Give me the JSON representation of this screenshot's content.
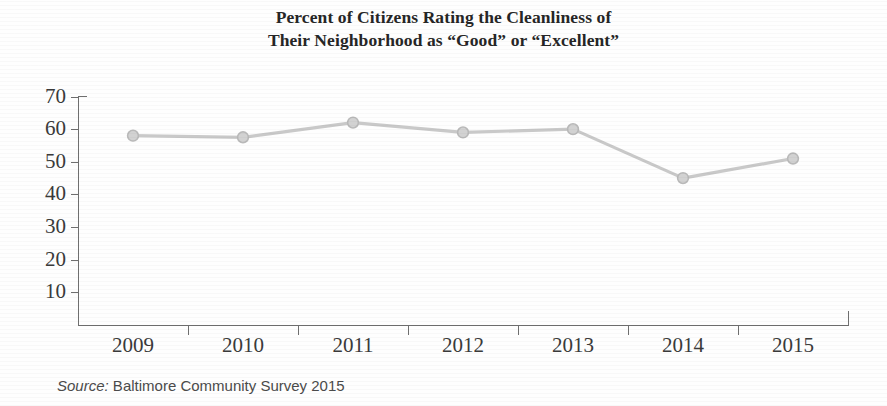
{
  "title": {
    "line1": "Percent of Citizens Rating the Cleanliness of",
    "line2": "Their Neighborhood as “Good” or “Excellent”"
  },
  "source": {
    "label": "Source:",
    "text": " Baltimore Community Survey 2015"
  },
  "colors": {
    "series_line": "#c9c9c9",
    "marker_fill": "#d2d2d2",
    "marker_stroke": "#b9b9b9",
    "axis": "#6f6f6f",
    "text": "#2b2b2b"
  },
  "chart_data": {
    "type": "line",
    "title": "Percent of Citizens Rating the Cleanliness of Their Neighborhood as “Good” or “Excellent”",
    "xlabel": "",
    "ylabel": "",
    "categories": [
      "2009",
      "2010",
      "2011",
      "2012",
      "2013",
      "2014",
      "2015"
    ],
    "values": [
      58,
      57.5,
      62,
      59,
      60,
      45,
      51
    ],
    "ylim": [
      0,
      70
    ],
    "yticks": [
      10,
      20,
      30,
      40,
      50,
      60,
      70
    ],
    "ytick_labels": [
      "10",
      "20",
      "30",
      "40",
      "50",
      "60",
      "70"
    ],
    "grid": false,
    "legend": false,
    "markers": "circle",
    "series": [
      {
        "name": "Percent rating cleanliness Good or Excellent",
        "values": [
          58,
          57.5,
          62,
          59,
          60,
          45,
          51
        ]
      }
    ]
  }
}
